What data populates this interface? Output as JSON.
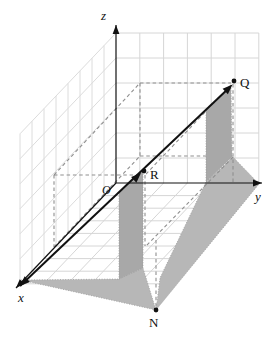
{
  "figure": {
    "canvas": {
      "width": 276,
      "height": 341
    },
    "colors": {
      "background": "#ffffff",
      "grid": "#d6d6d6",
      "grid_left": "#dcdcdc",
      "dashed": "#8f8f8f",
      "base_fill": "#b7b7b7",
      "curtain_fill": "#a8a8a8",
      "stipple_edge": "#9a9a9a",
      "ink": "#111111"
    },
    "labels": {
      "z": {
        "text": "z",
        "x": 101,
        "y": 20,
        "italic": true,
        "size": 13
      },
      "y": {
        "text": "y",
        "x": 255,
        "y": 201,
        "italic": true,
        "size": 13
      },
      "x": {
        "text": "x",
        "x": 18,
        "y": 302,
        "italic": true,
        "size": 13
      },
      "O": {
        "text": "O",
        "x": 102,
        "y": 194,
        "italic": true,
        "size": 12
      },
      "R": {
        "text": "R",
        "x": 150,
        "y": 179,
        "italic": false,
        "size": 13
      },
      "Q": {
        "text": "Q",
        "x": 240,
        "y": 87,
        "italic": false,
        "size": 13
      },
      "N": {
        "text": "N",
        "x": 149,
        "y": 327,
        "italic": false,
        "size": 13
      }
    },
    "points": {
      "R": {
        "x": 144,
        "y": 171,
        "r": 2.4
      },
      "Q": {
        "x": 234,
        "y": 81,
        "r": 2.4
      },
      "N": {
        "x": 156,
        "y": 310,
        "r": 2.4
      }
    },
    "axes": {
      "z": {
        "x1": 116,
        "y1": 183,
        "x2": 116,
        "y2": 25,
        "arrow": "end"
      },
      "y": {
        "x1": 116,
        "y1": 183,
        "x2": 262,
        "y2": 183,
        "arrow": "end"
      },
      "x": {
        "x1": 116,
        "y1": 183,
        "x2": 16,
        "y2": 288,
        "arrow": "end"
      }
    },
    "main_line": {
      "x1": 20,
      "y1": 286,
      "x2": 230,
      "y2": 87,
      "arrow_start": true,
      "arrow_end": true,
      "mid_arrow": {
        "x": 141,
        "y": 173
      }
    },
    "grids": {
      "origin": {
        "x": 116,
        "y": 183
      },
      "ux": {
        "x": -12,
        "y": 12.6,
        "n": 8
      },
      "uy": {
        "x": 23.8,
        "y": 0,
        "n": 6
      },
      "uz": {
        "x": 0,
        "y": -25,
        "n": 6
      }
    },
    "dashed_segments": [
      {
        "x1": 54,
        "y1": 175,
        "x2": 140,
        "y2": 83
      },
      {
        "x1": 54,
        "y1": 175,
        "x2": 142,
        "y2": 175
      },
      {
        "x1": 54,
        "y1": 175,
        "x2": 54,
        "y2": 247
      },
      {
        "x1": 140,
        "y1": 83,
        "x2": 231,
        "y2": 83
      },
      {
        "x1": 140,
        "y1": 83,
        "x2": 140,
        "y2": 156
      },
      {
        "x1": 54,
        "y1": 247,
        "x2": 140,
        "y2": 156
      },
      {
        "x1": 140,
        "y1": 156,
        "x2": 231,
        "y2": 156
      },
      {
        "x1": 231,
        "y1": 85,
        "x2": 146,
        "y2": 174
      },
      {
        "x1": 233,
        "y1": 157,
        "x2": 146,
        "y2": 246
      },
      {
        "x1": 145,
        "y1": 175,
        "x2": 145,
        "y2": 246
      },
      {
        "x1": 156,
        "y1": 240,
        "x2": 156,
        "y2": 308
      }
    ],
    "dashed_over": [
      {
        "x1": 233,
        "y1": 84,
        "x2": 233,
        "y2": 183
      }
    ],
    "base_polygons": [
      {
        "name": "base-shadow-triangle",
        "pts": [
          [
            21,
            280
          ],
          [
            119,
            279
          ],
          [
            143,
            268
          ],
          [
            156,
            310
          ]
        ]
      },
      {
        "name": "base-shadow-strip",
        "pts": [
          [
            206,
            182
          ],
          [
            233,
            157
          ],
          [
            259,
            184
          ],
          [
            156,
            310
          ],
          [
            160,
            278
          ]
        ]
      }
    ],
    "curtain_polygons": [
      {
        "name": "curtain-under-OR",
        "pts": [
          [
            119,
            192
          ],
          [
            143,
            170
          ],
          [
            143,
            268
          ],
          [
            119,
            279
          ]
        ]
      },
      {
        "name": "curtain-under-Q",
        "pts": [
          [
            206,
            110
          ],
          [
            231,
            86
          ],
          [
            232,
            157
          ],
          [
            206,
            182
          ]
        ]
      }
    ]
  }
}
